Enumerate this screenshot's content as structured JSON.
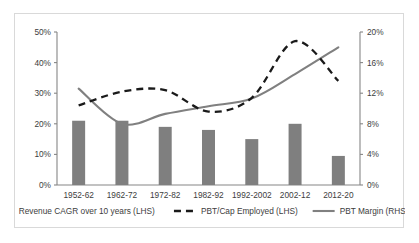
{
  "chart_data": {
    "type": "bar",
    "title": "",
    "subtitle": "",
    "xlabel": "",
    "ylabel": "",
    "categories": [
      "1952-62",
      "1962-72",
      "1972-82",
      "1982-92",
      "1992-2002",
      "2002-12",
      "2012-20"
    ],
    "grid": false,
    "legend_position": "bottom",
    "axes": {
      "left": {
        "label": "",
        "ylim": [
          0,
          50
        ],
        "ticks": [
          0,
          10,
          20,
          30,
          40,
          50
        ],
        "tick_labels": [
          "0%",
          "10%",
          "20%",
          "30%",
          "40%",
          "50%"
        ]
      },
      "right": {
        "label": "",
        "ylim": [
          0,
          20
        ],
        "ticks": [
          0,
          4,
          8,
          12,
          16,
          20
        ],
        "tick_labels": [
          "0%",
          "4%",
          "8%",
          "12%",
          "16%",
          "20%"
        ]
      }
    },
    "series": [
      {
        "name": "Revenue CAGR over 10 years (LHS)",
        "type": "bar",
        "axis": "left",
        "color": "#7f7f7f",
        "values": [
          21.0,
          21.0,
          19.0,
          18.0,
          15.0,
          20.0,
          9.5
        ]
      },
      {
        "name": "PBT/Cap Employed (LHS)",
        "type": "line",
        "style": "dashed",
        "axis": "left",
        "color": "#1a1a1a",
        "values": [
          26.0,
          30.5,
          31.0,
          24.0,
          28.5,
          47.0,
          34.0
        ]
      },
      {
        "name": "PBT Margin (RHS)",
        "type": "line",
        "style": "solid",
        "axis": "right",
        "color": "#808080",
        "values": [
          12.6,
          8.0,
          9.3,
          10.3,
          11.3,
          14.5,
          18.0
        ]
      }
    ]
  },
  "legend": {
    "items": [
      {
        "label": "Revenue CAGR over 10 years (LHS)",
        "marker": "bar-swatch",
        "color": "#7f7f7f"
      },
      {
        "label": "PBT/Cap Employed (LHS)",
        "marker": "dashed-line",
        "color": "#1a1a1a"
      },
      {
        "label": "PBT Margin (RHS)",
        "marker": "solid-line",
        "color": "#808080"
      }
    ]
  }
}
